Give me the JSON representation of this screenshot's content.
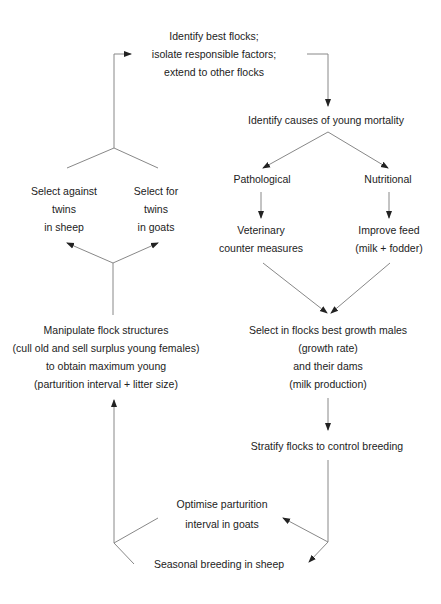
{
  "diagram": {
    "nodes": {
      "identify_best": [
        "Identify best flocks;",
        "isolate responsible factors;",
        "extend to other flocks"
      ],
      "identify_causes": [
        "Identify causes of young mortality"
      ],
      "pathological": [
        "Pathological"
      ],
      "nutritional": [
        "Nutritional"
      ],
      "veterinary": [
        "Veterinary",
        "counter measures"
      ],
      "improve_feed": [
        "Improve feed",
        "(milk + fodder)"
      ],
      "select_growth": [
        "Select in flocks best growth males",
        "(growth rate)",
        "and their dams",
        "(milk production)"
      ],
      "stratify": [
        "Stratify flocks to control breeding"
      ],
      "optimise": [
        "Optimise parturition",
        "interval in goats"
      ],
      "seasonal": [
        "Seasonal breeding in sheep"
      ],
      "manipulate": [
        "Manipulate flock structures",
        "(cull old and sell surplus young females)",
        "to obtain maximum young",
        "(parturition interval + litter size)"
      ],
      "select_against": [
        "Select against",
        "twins",
        "in sheep"
      ],
      "select_for": [
        "Select for",
        "twins",
        "in goats"
      ]
    },
    "colors": {
      "line": "#777777",
      "text": "#222222"
    }
  }
}
